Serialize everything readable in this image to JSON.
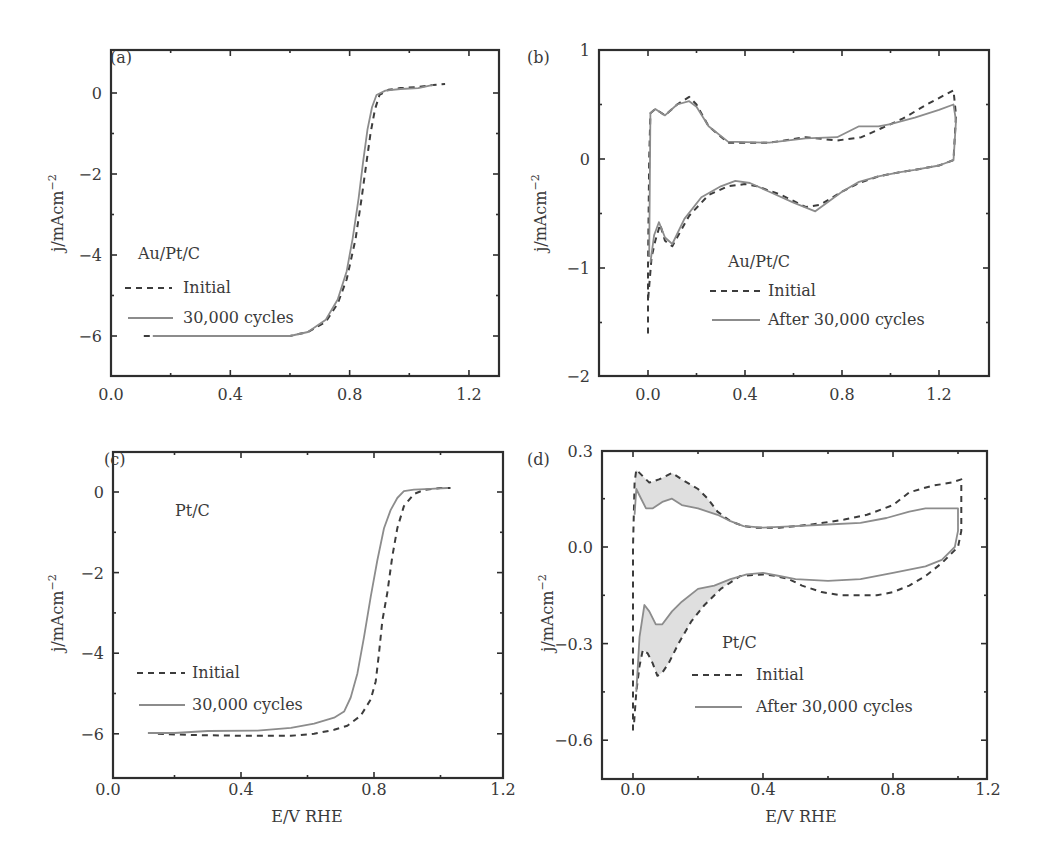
{
  "figure": {
    "panels": [
      {
        "id": "a",
        "label": "(a)",
        "annotation": "Au/Pt/C",
        "legend": [
          {
            "label": "Initial",
            "style": "dashed"
          },
          {
            "label": "30,000 cycles",
            "style": "solid"
          }
        ],
        "xlabel": "",
        "ylabel": "j/mAcm",
        "ylabel_sup": "−2",
        "xticks": [
          "0.0",
          "0.4",
          "0.8",
          "1.2"
        ],
        "yticks": [
          "0",
          "−2",
          "−4",
          "−6"
        ]
      },
      {
        "id": "b",
        "label": "(b)",
        "annotation": "Au/Pt/C",
        "legend": [
          {
            "label": "Initial",
            "style": "dashed"
          },
          {
            "label": "After 30,000 cycles",
            "style": "solid"
          }
        ],
        "xlabel": "",
        "ylabel": "j/mAcm",
        "ylabel_sup": "−2",
        "xticks": [
          "0.0",
          "0.4",
          "0.8",
          "1.2"
        ],
        "yticks": [
          "1",
          "0",
          "−1",
          "−2"
        ]
      },
      {
        "id": "c",
        "label": "(c)",
        "annotation": "Pt/C",
        "legend": [
          {
            "label": "Initial",
            "style": "dashed"
          },
          {
            "label": "30,000 cycles",
            "style": "solid"
          }
        ],
        "xlabel": "E/V RHE",
        "ylabel": "j/mAcm",
        "ylabel_sup": "−2",
        "xticks": [
          "0.0",
          "0.4",
          "0.8",
          "1.2"
        ],
        "yticks": [
          "0",
          "−2",
          "−4",
          "−6"
        ]
      },
      {
        "id": "d",
        "label": "(d)",
        "annotation": "Pt/C",
        "legend": [
          {
            "label": "Initial",
            "style": "dashed"
          },
          {
            "label": "After 30,000 cycles",
            "style": "solid"
          }
        ],
        "xlabel": "E/V RHE",
        "ylabel": "j/mAcm",
        "ylabel_sup": "−2",
        "xticks": [
          "0.0",
          "0.4",
          "0.8",
          "1.2"
        ],
        "yticks": [
          "0.3",
          "0.0",
          "−0.3",
          "−0.6"
        ]
      }
    ]
  },
  "chart_data": [
    {
      "panel": "a",
      "type": "line",
      "title": "Au/Pt/C ORR polarization",
      "xlabel": "E/V RHE",
      "ylabel": "j/mAcm−2",
      "xlim": [
        0.0,
        1.3
      ],
      "ylim": [
        -7,
        1.06
      ],
      "xticks": [
        0.0,
        0.4,
        0.8,
        1.2
      ],
      "yticks": [
        0,
        -2,
        -4,
        -6
      ],
      "legend_position": "center-left",
      "series": [
        {
          "name": "Initial",
          "style": "dashed",
          "x": [
            0.11,
            0.2,
            0.4,
            0.6,
            0.66,
            0.72,
            0.76,
            0.79,
            0.82,
            0.84,
            0.855,
            0.87,
            0.885,
            0.9,
            0.93,
            0.97,
            1.03,
            1.08,
            1.12
          ],
          "y": [
            -6.0,
            -6.0,
            -6.0,
            -6.0,
            -5.9,
            -5.65,
            -5.2,
            -4.6,
            -3.6,
            -2.6,
            -1.8,
            -1.0,
            -0.4,
            -0.05,
            0.08,
            0.12,
            0.15,
            0.2,
            0.22
          ]
        },
        {
          "name": "30,000 cycles",
          "style": "solid",
          "x": [
            0.14,
            0.2,
            0.4,
            0.6,
            0.66,
            0.72,
            0.76,
            0.79,
            0.81,
            0.83,
            0.845,
            0.86,
            0.875,
            0.89,
            0.92,
            0.97,
            1.03,
            1.08
          ],
          "y": [
            -6.0,
            -6.0,
            -6.0,
            -6.0,
            -5.9,
            -5.6,
            -5.1,
            -4.4,
            -3.6,
            -2.6,
            -1.7,
            -0.9,
            -0.35,
            -0.05,
            0.06,
            0.1,
            0.12,
            0.2
          ]
        }
      ]
    },
    {
      "panel": "b",
      "type": "line",
      "title": "Au/Pt/C cyclic voltammogram",
      "xlabel": "E/V RHE",
      "ylabel": "j/mAcm−2",
      "xlim": [
        -0.2,
        1.4
      ],
      "ylim": [
        -2,
        1
      ],
      "xticks": [
        0.0,
        0.4,
        0.8,
        1.2
      ],
      "yticks": [
        1,
        0,
        -1,
        -2
      ],
      "legend_position": "lower-center",
      "series": [
        {
          "name": "Initial",
          "style": "dashed",
          "x": [
            0.0,
            0.0,
            0.005,
            0.01,
            0.03,
            0.07,
            0.12,
            0.17,
            0.2,
            0.25,
            0.33,
            0.5,
            0.65,
            0.78,
            0.88,
            0.96,
            1.05,
            1.15,
            1.26,
            1.27,
            1.26,
            1.2,
            1.1,
            1.04,
            0.95,
            0.87,
            0.8,
            0.71,
            0.65,
            0.55,
            0.45,
            0.4,
            0.33,
            0.25,
            0.17,
            0.12,
            0.1,
            0.07,
            0.05,
            0.03,
            0.015,
            0.0
          ],
          "y": [
            -1.6,
            -1.0,
            0.0,
            0.42,
            0.46,
            0.4,
            0.5,
            0.57,
            0.5,
            0.3,
            0.15,
            0.15,
            0.2,
            0.17,
            0.2,
            0.28,
            0.37,
            0.5,
            0.63,
            0.4,
            -0.01,
            -0.06,
            -0.1,
            -0.12,
            -0.16,
            -0.22,
            -0.3,
            -0.42,
            -0.44,
            -0.33,
            -0.25,
            -0.23,
            -0.25,
            -0.33,
            -0.52,
            -0.72,
            -0.8,
            -0.75,
            -0.6,
            -0.75,
            -0.9,
            -1.3
          ]
        },
        {
          "name": "After 30,000 cycles",
          "style": "solid",
          "x": [
            0.005,
            0.01,
            0.03,
            0.07,
            0.12,
            0.17,
            0.2,
            0.25,
            0.33,
            0.5,
            0.65,
            0.78,
            0.87,
            0.95,
            1.0,
            1.1,
            1.2,
            1.26,
            1.27,
            1.26,
            1.2,
            1.1,
            1.04,
            0.95,
            0.87,
            0.8,
            0.69,
            0.6,
            0.5,
            0.42,
            0.36,
            0.3,
            0.22,
            0.15,
            0.1,
            0.07,
            0.045,
            0.025,
            0.01
          ],
          "y": [
            -0.9,
            0.42,
            0.46,
            0.4,
            0.5,
            0.53,
            0.48,
            0.3,
            0.16,
            0.15,
            0.19,
            0.2,
            0.3,
            0.3,
            0.32,
            0.38,
            0.45,
            0.5,
            0.35,
            -0.01,
            -0.06,
            -0.1,
            -0.12,
            -0.16,
            -0.21,
            -0.3,
            -0.48,
            -0.4,
            -0.3,
            -0.22,
            -0.2,
            -0.25,
            -0.35,
            -0.55,
            -0.78,
            -0.72,
            -0.58,
            -0.7,
            -0.95
          ]
        }
      ]
    },
    {
      "panel": "c",
      "type": "line",
      "title": "Pt/C ORR polarization",
      "xlabel": "E/V RHE",
      "ylabel": "j/mAcm−2",
      "xlim": [
        0.0,
        1.2
      ],
      "ylim": [
        -7.1,
        1.0
      ],
      "xticks": [
        0.0,
        0.4,
        0.8,
        1.2
      ],
      "yticks": [
        0,
        -2,
        -4,
        -6
      ],
      "legend_position": "center-left",
      "series": [
        {
          "name": "Initial",
          "style": "dashed",
          "x": [
            0.15,
            0.25,
            0.4,
            0.55,
            0.62,
            0.68,
            0.72,
            0.76,
            0.79,
            0.805,
            0.815,
            0.825,
            0.84,
            0.855,
            0.87,
            0.89,
            0.92,
            0.95,
            1.0,
            1.03
          ],
          "y": [
            -6.0,
            -6.03,
            -6.05,
            -6.05,
            -6.0,
            -5.9,
            -5.8,
            -5.55,
            -5.15,
            -4.7,
            -4.0,
            -3.2,
            -2.5,
            -1.6,
            -0.9,
            -0.35,
            -0.05,
            0.05,
            0.1,
            0.1
          ]
        },
        {
          "name": "30,000 cycles",
          "style": "solid",
          "x": [
            0.12,
            0.2,
            0.3,
            0.45,
            0.55,
            0.62,
            0.68,
            0.71,
            0.73,
            0.75,
            0.77,
            0.79,
            0.81,
            0.83,
            0.85,
            0.87,
            0.89,
            0.92,
            0.97,
            1.02
          ],
          "y": [
            -5.98,
            -5.98,
            -5.93,
            -5.92,
            -5.85,
            -5.75,
            -5.6,
            -5.45,
            -5.1,
            -4.5,
            -3.6,
            -2.6,
            -1.7,
            -0.9,
            -0.45,
            -0.15,
            0.02,
            0.06,
            0.08,
            0.1
          ]
        }
      ]
    },
    {
      "panel": "d",
      "type": "line",
      "title": "Pt/C cyclic voltammogram",
      "xlabel": "E/V RHE",
      "ylabel": "j/mAcm−2",
      "xlim": [
        -0.1,
        1.2
      ],
      "ylim": [
        -0.72,
        0.3
      ],
      "xticks": [
        0.0,
        0.4,
        0.8,
        1.2
      ],
      "yticks": [
        0.3,
        0.0,
        -0.3,
        -0.6
      ],
      "legend_position": "lower-center",
      "shaded_region": "area between Initial and After curves at low potential (0–0.3 V) shaded gray",
      "series": [
        {
          "name": "Initial",
          "style": "dashed",
          "x": [
            0.0,
            0.0,
            0.005,
            0.01,
            0.03,
            0.05,
            0.08,
            0.1,
            0.12,
            0.15,
            0.2,
            0.23,
            0.26,
            0.3,
            0.34,
            0.38,
            0.45,
            0.55,
            0.65,
            0.72,
            0.8,
            0.85,
            0.92,
            0.98,
            1.01,
            1.01,
            1.0,
            0.95,
            0.9,
            0.85,
            0.8,
            0.75,
            0.7,
            0.64,
            0.58,
            0.52,
            0.48,
            0.44,
            0.4,
            0.33,
            0.27,
            0.22,
            0.18,
            0.14,
            0.11,
            0.09,
            0.075,
            0.06,
            0.045,
            0.03,
            0.02,
            0.01,
            0.003
          ],
          "y": [
            -0.57,
            0.0,
            0.2,
            0.24,
            0.22,
            0.2,
            0.21,
            0.22,
            0.23,
            0.21,
            0.18,
            0.15,
            0.11,
            0.08,
            0.065,
            0.06,
            0.06,
            0.07,
            0.085,
            0.1,
            0.13,
            0.17,
            0.19,
            0.2,
            0.21,
            0.05,
            0.0,
            -0.05,
            -0.09,
            -0.12,
            -0.14,
            -0.15,
            -0.15,
            -0.15,
            -0.14,
            -0.12,
            -0.1,
            -0.09,
            -0.085,
            -0.09,
            -0.13,
            -0.18,
            -0.23,
            -0.3,
            -0.36,
            -0.39,
            -0.4,
            -0.36,
            -0.33,
            -0.32,
            -0.37,
            -0.45,
            -0.55
          ]
        },
        {
          "name": "After 30,000 cycles",
          "style": "solid",
          "x": [
            0.005,
            0.01,
            0.02,
            0.04,
            0.06,
            0.09,
            0.12,
            0.15,
            0.2,
            0.26,
            0.3,
            0.34,
            0.4,
            0.5,
            0.6,
            0.7,
            0.78,
            0.85,
            0.9,
            0.95,
            1.0,
            1.0,
            0.99,
            0.95,
            0.9,
            0.8,
            0.7,
            0.6,
            0.5,
            0.45,
            0.4,
            0.35,
            0.3,
            0.25,
            0.2,
            0.15,
            0.12,
            0.09,
            0.07,
            0.05,
            0.035,
            0.02,
            0.01
          ],
          "y": [
            0.1,
            0.18,
            0.16,
            0.12,
            0.12,
            0.14,
            0.15,
            0.13,
            0.12,
            0.1,
            0.08,
            0.065,
            0.06,
            0.065,
            0.07,
            0.075,
            0.09,
            0.11,
            0.12,
            0.12,
            0.12,
            0.05,
            0.0,
            -0.04,
            -0.06,
            -0.08,
            -0.1,
            -0.105,
            -0.1,
            -0.09,
            -0.08,
            -0.085,
            -0.1,
            -0.12,
            -0.13,
            -0.17,
            -0.2,
            -0.24,
            -0.24,
            -0.2,
            -0.18,
            -0.28,
            -0.45
          ]
        }
      ]
    }
  ]
}
